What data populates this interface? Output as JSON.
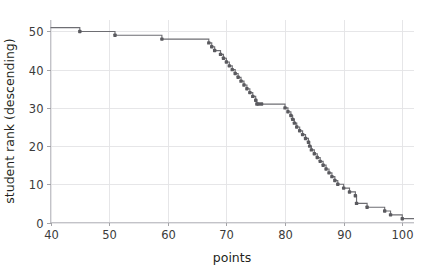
{
  "chart_data": {
    "type": "line",
    "variant": "step-post",
    "title": "",
    "subtitle": "",
    "xlabel": "points",
    "ylabel": "student rank (descending)",
    "xlim": [
      40,
      102
    ],
    "ylim": [
      0,
      53
    ],
    "xticks": [
      40,
      50,
      60,
      70,
      80,
      90,
      100
    ],
    "xtick_labels": [
      "40",
      "50",
      "60",
      "70",
      "80",
      "90",
      "100"
    ],
    "yticks": [
      0,
      10,
      20,
      30,
      40,
      50
    ],
    "ytick_labels": [
      "0",
      "10",
      "20",
      "30",
      "40",
      "50"
    ],
    "grid": true,
    "grid_axis": "both",
    "legend": null,
    "legend_position": "none",
    "marker": "square-dot",
    "line_color": "#6e6e73",
    "marker_color": "#5a5a5f",
    "grid_color": "#e3e3e6",
    "background_color": "#ffffff",
    "series": [
      {
        "name": "student rank vs points",
        "x": [
          45,
          51,
          59,
          67,
          67.5,
          68,
          69,
          69.5,
          70,
          70.5,
          71,
          71.5,
          72,
          72.5,
          73,
          73.5,
          74,
          74.5,
          75,
          75.2,
          75.5,
          76,
          80,
          80.5,
          81,
          81.3,
          81.6,
          82,
          82.5,
          83,
          83.5,
          84,
          84.2,
          84.5,
          85,
          85.5,
          86,
          86.5,
          87,
          87.5,
          88,
          88.5,
          89,
          90,
          91,
          92,
          92.2,
          94,
          97,
          98,
          100
        ],
        "y": [
          50,
          49,
          48,
          47,
          46,
          45,
          44,
          43,
          42,
          41,
          40,
          39,
          38,
          37,
          36,
          35,
          34,
          33,
          32,
          31,
          31,
          31,
          30,
          29,
          28,
          27,
          26,
          25,
          24,
          23,
          22,
          21,
          20,
          19,
          18,
          17,
          16,
          15,
          14,
          13,
          12,
          11,
          10,
          9,
          8,
          7,
          5,
          4,
          3,
          2,
          1
        ]
      }
    ],
    "start_level": 51,
    "n_students": 51
  },
  "axes": {
    "x_axis_name": "points-axis",
    "y_axis_name": "student-rank-axis"
  }
}
